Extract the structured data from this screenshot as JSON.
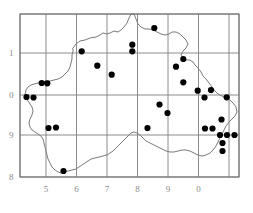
{
  "figure": {
    "type": "distribution-dot-map",
    "background_color": "#ffffff",
    "grid_color": "#808080",
    "frame_color": "#707070",
    "coastline_color": "#404040",
    "dot_color": "#000000",
    "label_color": "#8a8a8a"
  },
  "axes": {
    "x_labels": [
      "5",
      "6",
      "7",
      "8",
      "9",
      "0"
    ],
    "y_labels": [
      "1",
      "0",
      "9",
      "8"
    ],
    "x_label_positions": [
      46,
      76.5,
      107,
      137.5,
      168,
      198.5
    ],
    "y_label_positions": [
      53,
      95,
      135,
      177
    ],
    "frame": {
      "left": 20,
      "right": 239,
      "top": 14,
      "bottom": 177
    },
    "vertical_gridlines": [
      20,
      46,
      76.5,
      107,
      137.5,
      168,
      198.5,
      229,
      239
    ],
    "horizontal_gridlines": [
      14,
      53,
      95,
      135,
      177
    ]
  },
  "chart_data": {
    "type": "scatter",
    "title": "",
    "xlabel": "",
    "ylabel": "",
    "xlim": [
      20,
      239
    ],
    "ylim": [
      14,
      177
    ],
    "grid": true,
    "legend": "none",
    "series": [
      {
        "name": "records",
        "marker": "filled-circle",
        "marker_radius": 3.1,
        "color": "#000000",
        "points": [
          [
            154.3,
            28.0
          ],
          [
            132.3,
            44.7
          ],
          [
            132.3,
            51.3
          ],
          [
            81.7,
            51.3
          ],
          [
            183.3,
            59.0
          ],
          [
            176.0,
            66.7
          ],
          [
            97.3,
            65.7
          ],
          [
            111.7,
            74.7
          ],
          [
            41.7,
            83.0
          ],
          [
            47.3,
            83.3
          ],
          [
            183.3,
            82.3
          ],
          [
            26.5,
            97.0
          ],
          [
            33.5,
            97.5
          ],
          [
            197.7,
            90.7
          ],
          [
            211.0,
            90.0
          ],
          [
            226.7,
            97.3
          ],
          [
            204.5,
            97.5
          ],
          [
            159.5,
            104.5
          ],
          [
            167.5,
            113.0
          ],
          [
            48.5,
            128.0
          ],
          [
            56.0,
            127.5
          ],
          [
            147.5,
            128.0
          ],
          [
            205.0,
            128.5
          ],
          [
            212.5,
            128.5
          ],
          [
            221.5,
            119.5
          ],
          [
            220.0,
            135.0
          ],
          [
            227.0,
            135.0
          ],
          [
            234.5,
            135.0
          ],
          [
            222.5,
            143.0
          ],
          [
            222.5,
            151.0
          ],
          [
            63.5,
            171.0
          ]
        ]
      }
    ]
  },
  "outline": {
    "name": "region-boundary",
    "path": "M 73 48 L 76 44 L 80 41 L 85 40 L 90 38 L 96 37 L 100 35 L 103 33 L 107 34 L 110 33 L 114 31 L 118 32 L 121 30 L 124 27 L 127 23 L 129 18 L 131 14 L 134 14 L 136 19 L 138 24 L 141 27 L 145 29 L 149 29 L 153 30 L 157 32 L 161 34 L 165 35 L 169 34 L 172 32 L 176 32 L 180 34 L 183 37 L 186 40 L 188 44 L 186 48 L 183 51 L 181 55 L 183 58 L 186 60 L 190 60 L 193 62 L 195 65 L 198 68 L 201 72 L 203 76 L 206 79 L 209 83 L 212 87 L 215 91 L 218 94 L 222 96 L 226 98 L 230 100 L 233 103 L 236 107 L 237 112 L 235 116 L 232 119 L 229 122 L 226 126 L 224 130 L 222 134 L 220 138 L 218 142 L 216 146 L 213 150 L 210 153 L 206 155 L 202 156 L 198 155 L 194 153 L 190 151 L 186 150 L 182 150 L 178 151 L 174 152 L 170 152 L 166 151 L 162 149 L 158 147 L 154 145 L 150 143 L 146 141 L 143 138 L 140 135 L 137 133 L 134 132 L 131 133 L 128 136 L 125 139 L 122 142 L 119 145 L 116 148 L 113 151 L 110 153 L 107 155 L 103 156 L 99 157 L 95 158 L 91 159 L 88 161 L 85 163 L 82 165 L 79 167 L 76 169 L 72 170 L 68 171 L 64 172 L 61 173 L 58 172 L 55 170 L 52 167 L 50 163 L 48 159 L 47 155 L 46 151 L 45 147 L 44 143 L 43 139 L 41 136 L 38 134 L 35 132 L 32 130 L 30 127 L 29 123 L 30 119 L 32 115 L 33 111 L 32 107 L 30 104 L 28 101 L 26 98 L 25 94 L 26 90 L 28 87 L 31 85 L 34 84 L 38 83 L 42 82 L 46 81 L 50 81 L 54 80 L 58 79 L 62 77 L 65 74 L 68 71 L 70 67 L 71 63 L 72 59 L 72 55 L 73 51 Z"
  }
}
